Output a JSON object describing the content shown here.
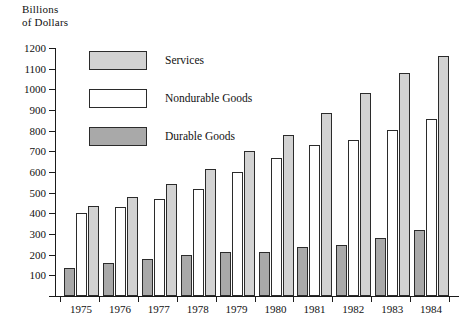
{
  "chart_data": {
    "type": "bar",
    "title": "Billions\nof Dollars",
    "xlabel": "",
    "ylabel": "Billions of Dollars",
    "ylim": [
      0,
      1200
    ],
    "ytick_step": 100,
    "yticks": [
      0,
      100,
      200,
      300,
      400,
      500,
      600,
      700,
      800,
      900,
      1000,
      1100,
      1200
    ],
    "ytick_labels": [
      "",
      "100",
      "200",
      "300",
      "400",
      "500",
      "600",
      "700",
      "800",
      "900",
      "1000",
      "1100",
      "1200"
    ],
    "grid": false,
    "legend_position": "upper-left-inside",
    "categories": [
      "1975",
      "1976",
      "1977",
      "1978",
      "1979",
      "1980",
      "1981",
      "1982",
      "1983",
      "1984"
    ],
    "series": [
      {
        "name": "Durable Goods",
        "color": "#a9a9a9",
        "values": [
          135,
          160,
          180,
          200,
          215,
          215,
          235,
          245,
          280,
          320
        ]
      },
      {
        "name": "Nondurable Goods",
        "color": "#ffffff",
        "values": [
          400,
          430,
          470,
          520,
          600,
          670,
          730,
          755,
          805,
          855
        ]
      },
      {
        "name": "Services",
        "color": "#d2d2d2",
        "values": [
          435,
          480,
          540,
          615,
          700,
          780,
          885,
          980,
          1080,
          1160
        ]
      }
    ]
  },
  "legend": {
    "items": [
      {
        "label": "Services",
        "swatch": "services"
      },
      {
        "label": "Nondurable Goods",
        "swatch": "nondur"
      },
      {
        "label": "Durable Goods",
        "swatch": "durable"
      }
    ]
  }
}
